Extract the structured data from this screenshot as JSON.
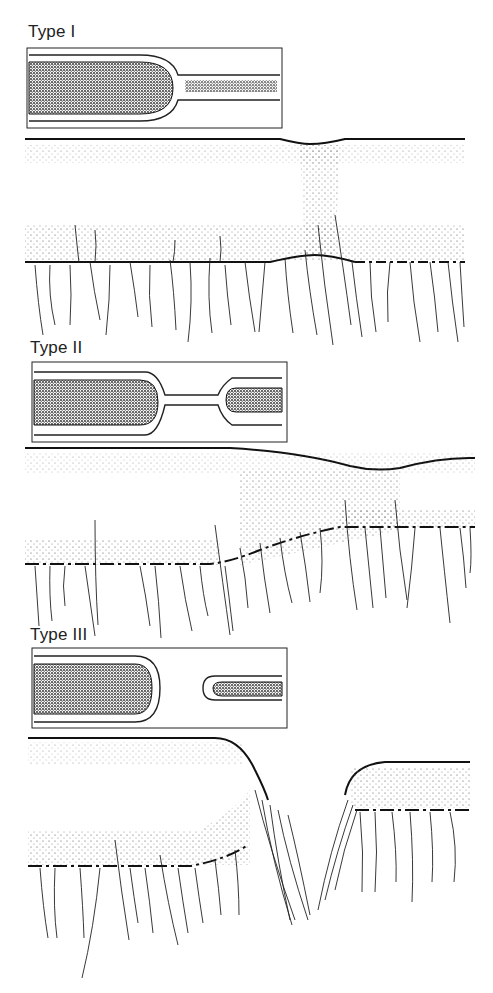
{
  "panels": [
    {
      "label": "Type I",
      "inset": {
        "x": 27,
        "y": 48,
        "w": 255,
        "h": 80
      },
      "separation": "constriction"
    },
    {
      "label": "Type II",
      "inset": {
        "x": 32,
        "y": 362,
        "w": 255,
        "h": 80
      },
      "separation": "narrow-neck"
    },
    {
      "label": "Type III",
      "inset": {
        "x": 32,
        "y": 648,
        "w": 255,
        "h": 80
      },
      "separation": "complete"
    }
  ],
  "colors": {
    "ink": "#111111",
    "stipple": "#555555",
    "background": "#ffffff"
  }
}
